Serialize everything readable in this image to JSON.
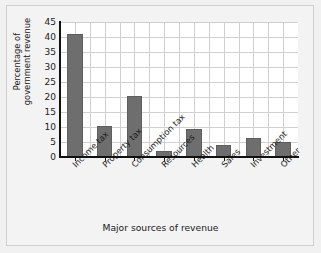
{
  "chart_data": {
    "type": "bar",
    "title": "",
    "xlabel": "Major sources of revenue",
    "ylabel": "Percentage of\ngovernment revenue",
    "categories": [
      "Income tax",
      "Property tax",
      "Consumption tax",
      "Resources",
      "Health",
      "Sales",
      "Investment",
      "Other"
    ],
    "values": [
      41,
      10.5,
      20.5,
      2,
      9.5,
      4,
      6.5,
      5
    ],
    "ylim": [
      0,
      45
    ],
    "yticks": [
      0,
      5,
      10,
      15,
      20,
      25,
      30,
      35,
      40,
      45
    ],
    "grid": true,
    "legend": "none",
    "bar_color": "#6e6e6e",
    "plot_background": "#ffffff",
    "figure_background": "#f1f1f1",
    "axis_color": "#111111",
    "grid_color": "#d0d0d0"
  }
}
